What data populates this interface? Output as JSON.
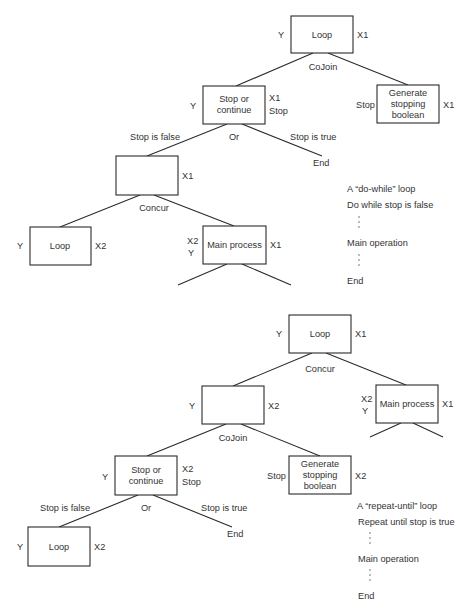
{
  "top_diagram": {
    "caption_title": "A “do-while” loop",
    "caption_lines": [
      "Do while stop is false",
      "Main operation",
      "End"
    ],
    "nodes": {
      "root": {
        "label": "Loop",
        "left_tag": "Y",
        "right_tag": "X1"
      },
      "stop_or_continue": {
        "label_1": "Stop or",
        "label_2": "continue",
        "left_tag": "Y",
        "right_tag_1": "X1",
        "right_tag_2": "Stop"
      },
      "generate": {
        "label_1": "Generate",
        "label_2": "stopping",
        "label_3": "boolean",
        "left_tag": "Stop",
        "right_tag": "X1"
      },
      "blank": {
        "right_tag": "X1"
      },
      "loop_child": {
        "label": "Loop",
        "left_tag": "Y",
        "right_tag": "X2"
      },
      "main_process": {
        "label": "Main process",
        "left_tag_1": "X2",
        "left_tag_2": "Y",
        "right_tag": "X1"
      }
    },
    "edge_labels": {
      "cojoin": "CoJoin",
      "or": "Or",
      "stop_false": "Stop is false",
      "stop_true": "Stop is true",
      "end": "End",
      "concur": "Concur"
    }
  },
  "bottom_diagram": {
    "caption_title": "A “repeat-until” loop",
    "caption_lines": [
      "Repeat until stop is true",
      "Main operation",
      "End"
    ],
    "nodes": {
      "root": {
        "label": "Loop",
        "left_tag": "Y",
        "right_tag": "X1"
      },
      "blank": {
        "left_tag": "Y",
        "right_tag": "X2"
      },
      "main_process": {
        "label": "Main process",
        "left_tag_1": "X2",
        "left_tag_2": "Y",
        "right_tag": "X1"
      },
      "stop_or_continue": {
        "label_1": "Stop or",
        "label_2": "continue",
        "left_tag": "Y",
        "right_tag_1": "X2",
        "right_tag_2": "Stop"
      },
      "generate": {
        "label_1": "Generate",
        "label_2": "stopping",
        "label_3": "boolean",
        "left_tag": "Stop",
        "right_tag": "X2"
      },
      "loop_child": {
        "label": "Loop",
        "left_tag": "Y",
        "right_tag": "X2"
      }
    },
    "edge_labels": {
      "concur": "Concur",
      "cojoin": "CoJoin",
      "or": "Or",
      "stop_false": "Stop is false",
      "stop_true": "Stop is true",
      "end": "End"
    }
  }
}
